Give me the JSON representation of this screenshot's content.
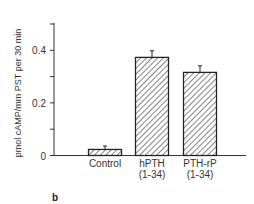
{
  "chart_data": {
    "type": "bar",
    "title": "",
    "panel_label": "b",
    "xlabel": "",
    "ylabel": "pmol cAMP/mm PST per 30 min",
    "ylim": [
      0,
      0.5
    ],
    "yticks": [
      "0",
      "0.2",
      "0.4"
    ],
    "categories": [
      {
        "line1": "Control",
        "line2": ""
      },
      {
        "line1": "hPTH",
        "line2": "(1-34)"
      },
      {
        "line1": "PTH-rP",
        "line2": "(1-34)"
      }
    ],
    "values": [
      0.023,
      0.373,
      0.316
    ],
    "errors": [
      0.013,
      0.025,
      0.025
    ],
    "grid": false,
    "fill": "diagonal-hatch"
  }
}
